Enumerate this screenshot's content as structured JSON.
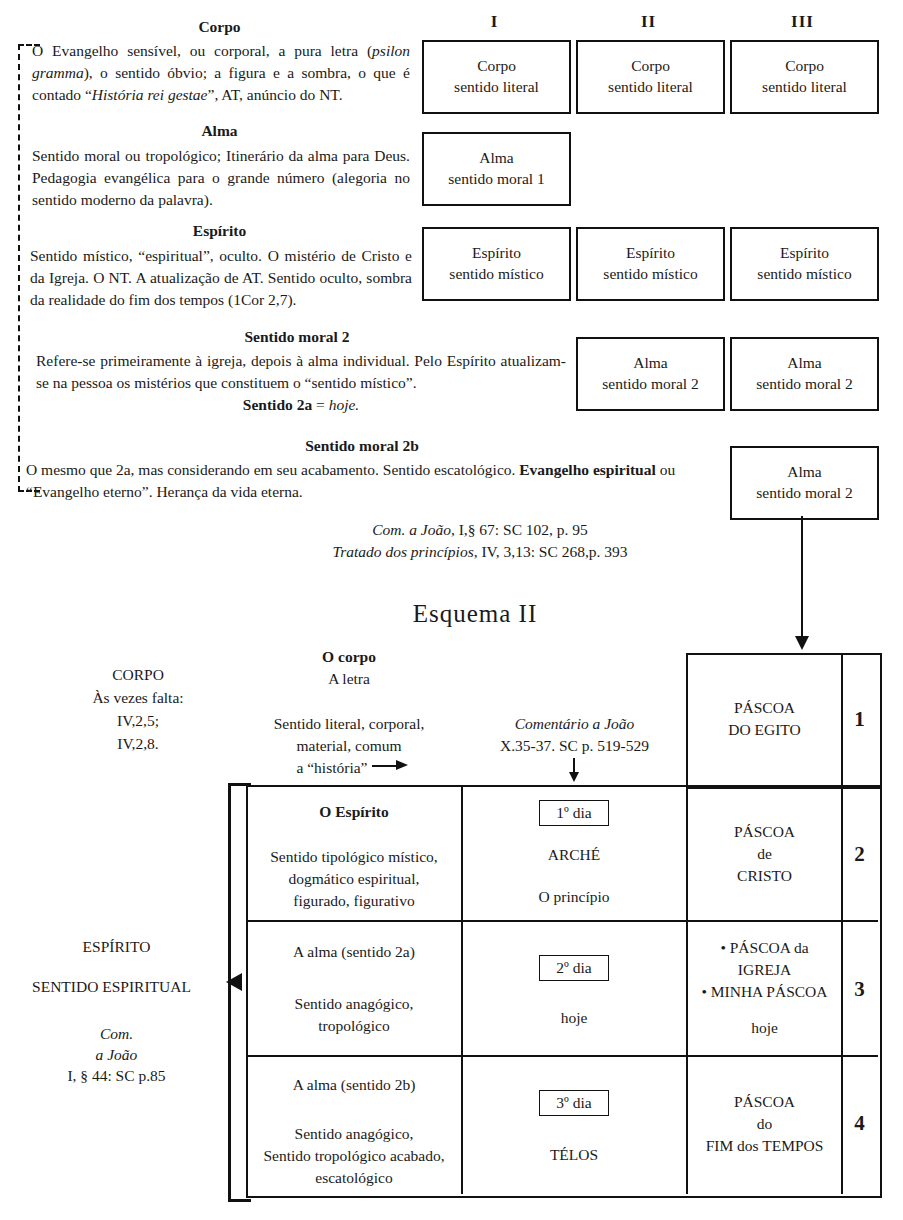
{
  "scheme1": {
    "column_headers": [
      "I",
      "II",
      "III"
    ],
    "left_blocks": [
      {
        "heading": "Corpo",
        "body_html": "O Evangelho sensível, ou corporal, a pura letra (<i>psilon gramma</i>), o sentido óbvio; a figura e a sombra, o que é contado “<i>História rei gestae</i>”, AT, anúncio do NT.",
        "body_text": "O Evangelho sensível, ou corporal, a pura letra (psilon gramma), o sentido óbvio; a figura e a sombra, o que é contado “História rei gestae”, AT, anúncio do NT."
      },
      {
        "heading": "Alma",
        "body_html": "Sentido moral ou tropológico; Itinerário da alma para Deus. Pedagogia evangélica para o grande número (alegoria no sentido moderno da palavra).",
        "body_text": "Sentido moral ou tropológico; Itinerário da alma para Deus. Pedagogia evangélica para o grande número (alegoria no sentido moderno da palavra)."
      },
      {
        "heading": "Espírito",
        "body_html": "Sentido místico, “espiritual”, oculto. O mistério de Cristo e da Igreja. O NT. A atualização de AT. Sentido oculto, sombra da realidade do fim dos tempos (1Cor 2,7).",
        "body_text": "Sentido místico, “espiritual”, oculto. O mistério de Cristo e da Igreja. O NT. A atualização de AT. Sentido oculto, sombra da realidade do fim dos tempos (1Cor 2,7)."
      },
      {
        "heading": "Sentido moral 2",
        "body_html": "Refere-se primeiramente à igreja, depois à alma individual. Pelo Espírito atualizam-se na pessoa os mistérios que constituem o “sentido místico”.",
        "body_text": "Refere-se primeiramente à igreja, depois à alma individual. Pelo Espírito atualizam-se na pessoa os mistérios que constituem o “sentido místico”.",
        "footer_html": "<b>Sentido 2a</b> = <i>hoje.</i>",
        "footer_text": "Sentido 2a = hoje."
      },
      {
        "heading": "Sentido moral 2b",
        "body_html": "O mesmo que 2a, mas considerando em seu acabamento. Sentido escatológico. <b>Evangelho espiritual</b> ou “Evangelho eterno”. Herança da vida eterna.",
        "body_text": "O mesmo que 2a, mas considerando em seu acabamento. Sentido escatológico. Evangelho espiritual ou “Evangelho eterno”. Herança da vida eterna."
      }
    ],
    "citations": [
      {
        "html": "<i>Com. a João</i>, I,§ 67: SC 102, p. 95",
        "text": "Com. a João, I,§ 67: SC 102, p. 95"
      },
      {
        "html": "<i>Tratado dos princípios</i>, IV, 3,13: SC 268,p. 393",
        "text": "Tratado dos princípios, IV, 3,13: SC 268,p. 393"
      }
    ],
    "boxes": {
      "row_corpo": [
        {
          "line1": "Corpo",
          "line2": "sentido literal"
        },
        {
          "line1": "Corpo",
          "line2": "sentido literal"
        },
        {
          "line1": "Corpo",
          "line2": "sentido literal"
        }
      ],
      "row_alma1": [
        {
          "line1": "Alma",
          "line2": "sentido moral 1"
        }
      ],
      "row_espirito": [
        {
          "line1": "Espírito",
          "line2": "sentido místico"
        },
        {
          "line1": "Espírito",
          "line2": "sentido místico"
        },
        {
          "line1": "Espírito",
          "line2": "sentido místico"
        }
      ],
      "row_alma2": [
        {
          "line1": "Alma",
          "line2": "sentido moral 2"
        },
        {
          "line1": "Alma",
          "line2": "sentido moral 2"
        }
      ],
      "row_alma2b": [
        {
          "line1": "Alma",
          "line2": "sentido moral 2"
        }
      ]
    }
  },
  "scheme2": {
    "title": "Esquema II",
    "left_corpo": {
      "l1": "CORPO",
      "l2": "Às vezes falta:",
      "l3": "IV,2,5;",
      "l4": "IV,2,8."
    },
    "left_espirito": {
      "l1": "ESPÍRITO",
      "l2": "SENTIDO ESPIRITUAL",
      "c1": "Com.",
      "c2": "a João",
      "c3": "I, § 44: SC p.85"
    },
    "header_corpo": {
      "title": "O corpo",
      "sub": "A letra",
      "b1": "Sentido literal, corporal,",
      "b2": "material, comum",
      "b3": "a “história”"
    },
    "header_comentario": {
      "l1": "Comentário a João",
      "l2": "X.35-37. SC p. 519-529"
    },
    "rows": [
      {
        "number": "1",
        "col_sentido": [],
        "col_dia": [],
        "col_pascoa": [
          "PÁSCOA",
          "DO EGITO"
        ]
      },
      {
        "number": "2",
        "col_sentido_title": "O Espírito",
        "col_sentido": [
          "Sentido tipológico místico,",
          "dogmático espiritual,",
          "figurado, figurativo"
        ],
        "col_dia_badge": "1º dia",
        "col_dia": [
          "ARCHÉ",
          "O princípio"
        ],
        "col_pascoa": [
          "PÁSCOA",
          "de",
          "CRISTO"
        ]
      },
      {
        "number": "3",
        "col_sentido_title": "",
        "col_sentido": [
          "A alma (sentido 2a)",
          "Sentido anagógico,",
          "tropológico"
        ],
        "col_dia_badge": "2º dia",
        "col_dia": [
          "hoje"
        ],
        "col_pascoa": [
          "• PÁSCOA da",
          "IGREJA",
          "• MINHA PÁSCOA",
          "hoje"
        ]
      },
      {
        "number": "4",
        "col_sentido_title": "",
        "col_sentido": [
          "A alma (sentido 2b)",
          "Sentido anagógico,",
          "Sentido tropológico acabado,",
          "escatológico"
        ],
        "col_dia_badge": "3º dia",
        "col_dia": [
          "TÉLOS"
        ],
        "col_pascoa": [
          "PÁSCOA",
          "do",
          "FIM dos TEMPOS"
        ]
      }
    ]
  }
}
